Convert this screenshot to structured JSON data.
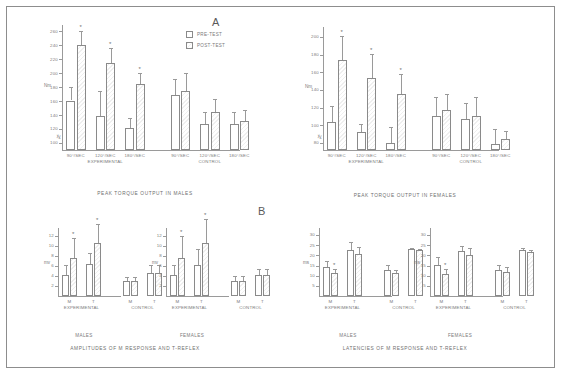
{
  "figure": {
    "panel_a_letter": "A",
    "panel_b_letter": "B"
  },
  "legend": {
    "pre_label": "PRE-TEST",
    "post_label": "POST-TEST"
  },
  "captions": {
    "torque_males": "PEAK TORQUE OUTPUT IN MALES",
    "torque_females": "PEAK TORQUE OUTPUT IN FEMALES",
    "amplitudes": "AMPLITUDES OF M RESPONSE AND T-REFLEX",
    "latencies": "LATENCIES OF M RESPONSE AND T-REFLEX",
    "males": "MALES",
    "females": "FEMALES"
  },
  "chart_data": [
    {
      "id": "peak-torque-males",
      "type": "bar",
      "title": "PEAK TORQUE OUTPUT IN MALES",
      "ylabel": "Nm",
      "xlabel": "",
      "ylim": [
        90,
        265
      ],
      "yticks": [
        100,
        120,
        140,
        160,
        180,
        200,
        220,
        240,
        260
      ],
      "axis_break": true,
      "grid": false,
      "legend_position": "top-right",
      "categories": [
        "90°/SEC",
        "120°/SEC",
        "180°/SEC",
        "90°/SEC",
        "120°/SEC",
        "180°/SEC"
      ],
      "groups": [
        {
          "name": "EXPERIMENTAL",
          "span": 3
        },
        {
          "name": "CONTROL",
          "span": 3
        }
      ],
      "series": [
        {
          "name": "PRE-TEST",
          "values": [
            161,
            139,
            121,
            169,
            127,
            127
          ],
          "errors": [
            19,
            35,
            15,
            23,
            18,
            17
          ]
        },
        {
          "name": "POST-TEST",
          "values": [
            241,
            215,
            185,
            174,
            144,
            131
          ],
          "errors": [
            20,
            22,
            16,
            27,
            19,
            17
          ]
        }
      ],
      "significance": [
        {
          "category_index": 0,
          "series": "POST-TEST",
          "marker": "*"
        },
        {
          "category_index": 1,
          "series": "POST-TEST",
          "marker": "*"
        },
        {
          "category_index": 2,
          "series": "POST-TEST",
          "marker": "*"
        }
      ]
    },
    {
      "id": "peak-torque-females",
      "type": "bar",
      "title": "PEAK TORQUE OUTPUT IN FEMALES",
      "ylabel": "Nm",
      "xlabel": "",
      "ylim": [
        72,
        208
      ],
      "yticks": [
        80,
        100,
        120,
        140,
        160,
        180,
        200
      ],
      "axis_break": true,
      "grid": false,
      "legend_position": "none",
      "categories": [
        "90°/SEC",
        "120°/SEC",
        "180°/SEC",
        "90°/SEC",
        "120°/SEC",
        "180°/SEC"
      ],
      "groups": [
        {
          "name": "EXPERIMENTAL",
          "span": 3
        },
        {
          "name": "CONTROL",
          "span": 3
        }
      ],
      "series": [
        {
          "name": "PRE-TEST",
          "values": [
            104,
            92,
            80,
            110,
            107,
            79
          ],
          "errors": [
            18,
            10,
            18,
            22,
            18,
            17
          ]
        },
        {
          "name": "POST-TEST",
          "values": [
            174,
            154,
            135,
            117,
            110,
            84
          ],
          "errors": [
            27,
            27,
            23,
            19,
            22,
            9
          ]
        }
      ],
      "significance": [
        {
          "category_index": 0,
          "series": "POST-TEST",
          "marker": "*"
        },
        {
          "category_index": 1,
          "series": "POST-TEST",
          "marker": "*"
        },
        {
          "category_index": 2,
          "series": "POST-TEST",
          "marker": "*"
        }
      ]
    },
    {
      "id": "amplitudes-males",
      "type": "bar",
      "title": "MALES",
      "ylabel": "mv",
      "xlabel": "",
      "ylim": [
        0,
        13
      ],
      "yticks": [
        2,
        4,
        6,
        8,
        10,
        12
      ],
      "grid": false,
      "legend_position": "none",
      "categories": [
        "M",
        "T",
        "M",
        "T"
      ],
      "groups": [
        {
          "name": "EXPERIMENTAL",
          "span": 2
        },
        {
          "name": "CONTROL",
          "span": 2
        }
      ],
      "series": [
        {
          "name": "PRE-TEST",
          "values": [
            4.2,
            6.4,
            3.0,
            4.6
          ],
          "errors": [
            2.1,
            2.3,
            0.9,
            1.6
          ]
        },
        {
          "name": "POST-TEST",
          "values": [
            7.6,
            10.6,
            3.0,
            4.6
          ],
          "errors": [
            4.0,
            3.9,
            0.9,
            1.6
          ]
        }
      ],
      "significance": [
        {
          "category_index": 0,
          "series": "POST-TEST",
          "marker": "*"
        },
        {
          "category_index": 1,
          "series": "POST-TEST",
          "marker": "*"
        }
      ]
    },
    {
      "id": "amplitudes-females",
      "type": "bar",
      "title": "FEMALES",
      "ylabel": "mv",
      "xlabel": "",
      "ylim": [
        0,
        13
      ],
      "yticks": [
        2,
        4,
        6,
        8,
        10,
        12
      ],
      "grid": false,
      "legend_position": "none",
      "categories": [
        "M",
        "T",
        "M",
        "T"
      ],
      "groups": [
        {
          "name": "EXPERIMENTAL",
          "span": 2
        },
        {
          "name": "CONTROL",
          "span": 2
        }
      ],
      "series": [
        {
          "name": "PRE-TEST",
          "values": [
            4.3,
            6.3,
            3.1,
            4.2
          ],
          "errors": [
            2.0,
            3.2,
            1.0,
            1.3
          ]
        },
        {
          "name": "POST-TEST",
          "values": [
            7.7,
            10.6,
            3.1,
            4.2
          ],
          "errors": [
            4.3,
            4.8,
            1.0,
            1.3
          ]
        }
      ],
      "significance": [
        {
          "category_index": 0,
          "series": "POST-TEST",
          "marker": "*"
        },
        {
          "category_index": 1,
          "series": "POST-TEST",
          "marker": "*"
        }
      ]
    },
    {
      "id": "latencies-males",
      "type": "bar",
      "title": "MALES",
      "ylabel": "ms",
      "xlabel": "",
      "ylim": [
        0,
        32
      ],
      "yticks": [
        5,
        10,
        15,
        20,
        25,
        30
      ],
      "grid": false,
      "legend_position": "none",
      "categories": [
        "M",
        "T",
        "M",
        "T"
      ],
      "groups": [
        {
          "name": "EXPERIMENTAL",
          "span": 2
        },
        {
          "name": "CONTROL",
          "span": 2
        }
      ],
      "series": [
        {
          "name": "PRE-TEST",
          "values": [
            14.5,
            22.5,
            13.0,
            23.0
          ],
          "errors": [
            2.8,
            4.2,
            2.5,
            0.8
          ]
        },
        {
          "name": "POST-TEST",
          "values": [
            11.5,
            20.5,
            11.5,
            22.5
          ],
          "errors": [
            1.6,
            3.8,
            1.2,
            0.7
          ]
        }
      ],
      "significance": [
        {
          "category_index": 0,
          "series": "POST-TEST",
          "marker": "*"
        }
      ]
    },
    {
      "id": "latencies-females",
      "type": "bar",
      "title": "FEMALES",
      "ylabel": "ms",
      "xlabel": "",
      "ylim": [
        0,
        32
      ],
      "yticks": [
        5,
        10,
        15,
        20,
        25,
        30
      ],
      "grid": false,
      "legend_position": "none",
      "categories": [
        "M",
        "T",
        "M",
        "T"
      ],
      "groups": [
        {
          "name": "EXPERIMENTAL",
          "span": 2
        },
        {
          "name": "CONTROL",
          "span": 2
        }
      ],
      "series": [
        {
          "name": "PRE-TEST",
          "values": [
            15.3,
            22.0,
            13.0,
            22.5
          ],
          "errors": [
            4.0,
            2.5,
            2.5,
            1.2
          ]
        },
        {
          "name": "POST-TEST",
          "values": [
            10.7,
            20.3,
            11.7,
            21.5
          ],
          "errors": [
            2.4,
            3.3,
            2.8,
            1.3
          ]
        }
      ],
      "significance": [
        {
          "category_index": 0,
          "series": "POST-TEST",
          "marker": "*"
        }
      ]
    }
  ],
  "colors": {
    "axis": "#9a9a9a",
    "text": "#7b7b7b",
    "frame": "#8d8d8d",
    "bar_pre": "#ffffff",
    "bar_post": "#efefef"
  }
}
